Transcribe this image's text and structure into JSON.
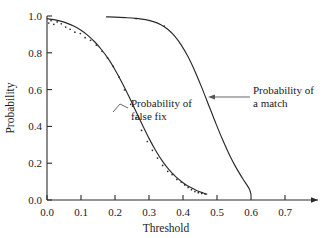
{
  "chart_data": {
    "type": "line",
    "title": "",
    "xlabel": "Threshold",
    "ylabel": "Probability",
    "xlim": [
      0.0,
      0.75
    ],
    "ylim": [
      0.0,
      1.04
    ],
    "grid": false,
    "legend_position": "inline-annotations",
    "xticks": [
      "0.0",
      "0.1",
      "0.2",
      "0.3",
      "0.4",
      "0.5",
      "0.6",
      "0.7"
    ],
    "xtick_values": [
      0.0,
      0.1,
      0.2,
      0.3,
      0.4,
      0.5,
      0.6,
      0.7
    ],
    "yticks": [
      "0.0",
      "0.2",
      "0.4",
      "0.6",
      "0.8",
      "1.0"
    ],
    "ytick_values": [
      0.0,
      0.2,
      0.4,
      0.6,
      0.8,
      1.0
    ],
    "series": [
      {
        "name": "Probability of false fix",
        "style": "curve-with-scatter",
        "x": [
          0.0,
          0.02,
          0.04,
          0.06,
          0.08,
          0.1,
          0.12,
          0.14,
          0.16,
          0.18,
          0.2,
          0.22,
          0.24,
          0.26,
          0.28,
          0.3,
          0.32,
          0.34,
          0.36,
          0.38,
          0.4,
          0.42,
          0.44,
          0.46,
          0.47
        ],
        "y": [
          0.985,
          0.98,
          0.972,
          0.96,
          0.944,
          0.922,
          0.895,
          0.86,
          0.818,
          0.768,
          0.708,
          0.64,
          0.566,
          0.488,
          0.41,
          0.335,
          0.268,
          0.21,
          0.162,
          0.124,
          0.094,
          0.07,
          0.052,
          0.038,
          0.032
        ],
        "scatter_x": [
          0.005,
          0.012,
          0.02,
          0.03,
          0.042,
          0.055,
          0.068,
          0.082,
          0.098,
          0.112,
          0.128,
          0.145,
          0.162,
          0.178,
          0.195,
          0.212,
          0.228,
          0.246,
          0.262,
          0.278,
          0.295,
          0.31,
          0.325,
          0.34,
          0.355,
          0.368,
          0.382,
          0.395,
          0.405,
          0.415,
          0.425,
          0.435,
          0.445,
          0.455,
          0.465
        ],
        "scatter_y": [
          0.962,
          0.975,
          0.955,
          0.968,
          0.958,
          0.94,
          0.928,
          0.912,
          0.905,
          0.882,
          0.868,
          0.842,
          0.808,
          0.772,
          0.726,
          0.668,
          0.598,
          0.52,
          0.448,
          0.378,
          0.318,
          0.27,
          0.228,
          0.188,
          0.156,
          0.138,
          0.112,
          0.098,
          0.082,
          0.068,
          0.056,
          0.046,
          0.04,
          0.036,
          0.032
        ]
      },
      {
        "name": "Probability of a match",
        "style": "curve",
        "x": [
          0.175,
          0.2,
          0.23,
          0.26,
          0.29,
          0.315,
          0.335,
          0.355,
          0.375,
          0.395,
          0.415,
          0.435,
          0.455,
          0.475,
          0.495,
          0.515,
          0.535,
          0.555,
          0.575,
          0.595,
          0.6
        ],
        "y": [
          0.995,
          0.994,
          0.991,
          0.987,
          0.98,
          0.968,
          0.952,
          0.928,
          0.892,
          0.842,
          0.778,
          0.7,
          0.612,
          0.518,
          0.424,
          0.334,
          0.252,
          0.18,
          0.118,
          0.06,
          0.03
        ],
        "scatter_x": [
          0.262,
          0.345
        ],
        "scatter_y": [
          0.986,
          0.945
        ]
      }
    ],
    "annotations": [
      {
        "text_line1": "Probability of",
        "text_line2": "false fix",
        "target_series": "Probability of false fix"
      },
      {
        "text_line1": "Probability of",
        "text_line2": "a match",
        "target_series": "Probability of a match"
      }
    ]
  }
}
